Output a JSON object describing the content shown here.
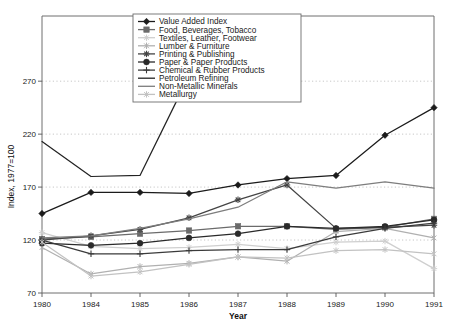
{
  "chart_data": {
    "type": "line",
    "title": "",
    "xlabel": "Year",
    "ylabel": "Index, 1977=100",
    "x": [
      "1980",
      "1984",
      "1985",
      "1986",
      "1987",
      "1988",
      "1989",
      "1990",
      "1991"
    ],
    "xtick_labels": [
      "1980",
      "1984",
      "1985",
      "1986",
      "1987",
      "1988",
      "1989",
      "1990",
      "1991"
    ],
    "ytick_labels": [
      "70",
      "120",
      "170",
      "220",
      "270"
    ],
    "ytick_values": [
      70,
      120,
      170,
      220,
      270
    ],
    "ylim": [
      70,
      290
    ],
    "grid": true,
    "legend_position": "top-right",
    "series": [
      {
        "name": "Value Added Index",
        "marker": "diamond",
        "color": "#1b1b1b",
        "values": [
          145,
          165,
          165,
          164,
          172,
          178,
          181,
          219,
          245
        ]
      },
      {
        "name": "Food, Beverages, Tobacco",
        "marker": "square",
        "color": "#6b6b6b",
        "values": [
          121,
          123,
          126,
          129,
          133,
          133,
          130,
          132,
          140
        ]
      },
      {
        "name": "Textiles, Leather, Footwear",
        "marker": "asterisk-light",
        "color": "#cfcfcf",
        "values": [
          127,
          114,
          112,
          113,
          116,
          112,
          118,
          119,
          93
        ]
      },
      {
        "name": "Lumber & Furniture",
        "marker": "star",
        "color": "#b0b0b0",
        "values": [
          113,
          88,
          95,
          98,
          104,
          100,
          128,
          131,
          122
        ]
      },
      {
        "name": "Printing & Publishing",
        "marker": "asterisk",
        "color": "#444444",
        "values": [
          120,
          124,
          130,
          141,
          158,
          172,
          131,
          132,
          134
        ]
      },
      {
        "name": "Paper & Paper Products",
        "marker": "circle",
        "color": "#2a2a2a",
        "values": [
          117,
          115,
          117,
          122,
          126,
          133,
          131,
          133,
          139
        ]
      },
      {
        "name": "Chemical & Rubber Products",
        "marker": "plus",
        "color": "#3b3b3b",
        "values": [
          120,
          107,
          107,
          110,
          111,
          111,
          123,
          131,
          136
        ]
      },
      {
        "name": "Petroleum Refining",
        "marker": "none",
        "color": "#232323",
        "values": [
          213,
          180,
          181,
          275,
          null,
          null,
          null,
          null,
          null
        ]
      },
      {
        "name": "Non-Metallic Minerals",
        "marker": "none",
        "color": "#7d7d7d",
        "values": [
          122,
          124,
          131,
          140,
          151,
          175,
          169,
          175,
          169
        ]
      },
      {
        "name": "Metallurgy",
        "marker": "star-light",
        "color": "#c2c2c2",
        "values": [
          118,
          86,
          90,
          97,
          104,
          103,
          110,
          111,
          107
        ]
      }
    ]
  },
  "legend": {
    "items": [
      {
        "label": "Value Added Index"
      },
      {
        "label": "Food, Beverages, Tobacco"
      },
      {
        "label": "Textiles, Leather, Footwear"
      },
      {
        "label": "Lumber & Furniture"
      },
      {
        "label": "Printing & Publishing"
      },
      {
        "label": "Paper & Paper Products"
      },
      {
        "label": "Chemical & Rubber Products"
      },
      {
        "label": "Petroleum Refining"
      },
      {
        "label": "Non-Metallic Minerals"
      },
      {
        "label": "Metallurgy"
      }
    ]
  }
}
